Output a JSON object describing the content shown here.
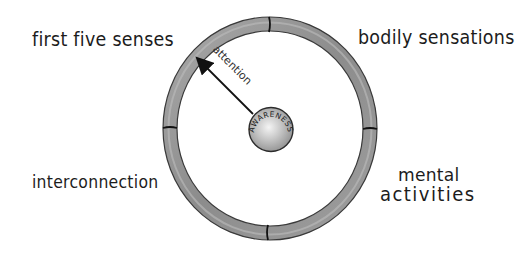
{
  "diagram": {
    "center": {
      "label": "AWARENESS"
    },
    "arrow": {
      "label": "attention"
    },
    "ring": {
      "segments": 4
    },
    "labels": {
      "first_five_senses": "first five senses",
      "bodily_sensations": "bodily sensations",
      "interconnection": "interconnection",
      "mental": "mental",
      "activities": "activities"
    },
    "colors": {
      "ring_fill": "#9a9a9a",
      "ring_edge": "#3a3a3a",
      "core_fill": "#bdbdbd",
      "ink": "#1c1c1c",
      "background": "#ffffff"
    }
  }
}
